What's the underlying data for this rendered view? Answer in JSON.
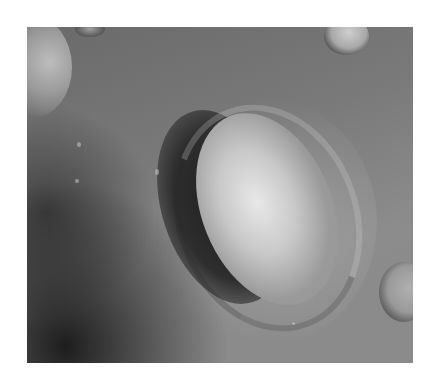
{
  "image": {
    "description": "Grayscale orbital photograph of a large eroded mesa resembling a face, side-lit from the right, surrounded by smaller craters",
    "subject": "mesa",
    "palette": {
      "background": "#ffffff",
      "terrain_mid": "#7a7a7a",
      "shadow": "#1e1e1e",
      "highlight": "#e8e8e8"
    }
  }
}
